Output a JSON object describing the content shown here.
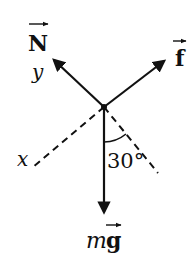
{
  "diagram": {
    "type": "free-body-diagram",
    "colors": {
      "stroke": "#111111",
      "background": "#ffffff"
    },
    "origin": {
      "x": 104,
      "y": 107
    },
    "forces": [
      {
        "id": "N",
        "symbol": "N",
        "vector": true,
        "label": "Normal force",
        "direction": "up-left"
      },
      {
        "id": "f",
        "symbol": "f",
        "vector": true,
        "label": "Friction force",
        "direction": "up-right"
      },
      {
        "id": "mg",
        "symbol_prefix": "m",
        "symbol": "g",
        "vector": true,
        "label": "Weight",
        "direction": "down"
      }
    ],
    "axes": [
      {
        "id": "x",
        "label": "x",
        "style": "dashed",
        "direction": "down-left"
      },
      {
        "id": "y",
        "label": "y",
        "style": "solid (along N)",
        "direction": "up-left"
      }
    ],
    "angle": {
      "value": "30°",
      "between": [
        "mg",
        "dashed line down-right"
      ]
    },
    "labels": {
      "N": "N",
      "y": "y",
      "f": "f",
      "x": "x",
      "angle": "30°",
      "mg_m": "m",
      "mg_g": "g"
    }
  }
}
